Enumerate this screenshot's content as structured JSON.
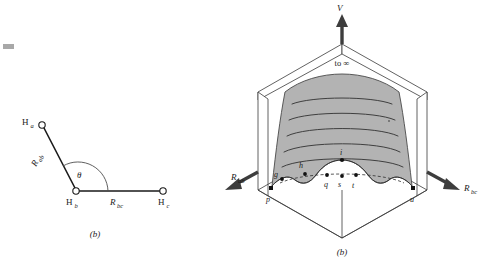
{
  "figure": {
    "background_color": "#ffffff",
    "ink_color": "#1a1a1a",
    "surface_fill": "#b3b3b3"
  },
  "panel_left": {
    "name": "h3-geometry-diagram",
    "caption": "(b)",
    "atoms": [
      {
        "id": "atom-ha",
        "element": "H",
        "subscript": "a"
      },
      {
        "id": "atom-hb",
        "element": "H",
        "subscript": "b"
      },
      {
        "id": "atom-hc",
        "element": "H",
        "subscript": "c"
      }
    ],
    "bonds": [
      {
        "id": "bond-ab",
        "label": "R",
        "subscript": "ab"
      },
      {
        "id": "bond-bc",
        "label": "R",
        "subscript": "bc"
      }
    ],
    "angle": {
      "id": "bond-angle",
      "symbol": "θ"
    }
  },
  "panel_right": {
    "name": "potential-energy-surface-3d",
    "caption": "(b)",
    "axes": [
      {
        "id": "axis-v",
        "label": "V",
        "subscript": "",
        "direction": "up"
      },
      {
        "id": "axis-rab",
        "label": "R",
        "subscript": "ab",
        "direction": "left-down"
      },
      {
        "id": "axis-rbc",
        "label": "R",
        "subscript": "bc",
        "direction": "right-down"
      }
    ],
    "annotations": [
      {
        "id": "to-infinity-label",
        "text": "to ∞"
      }
    ],
    "surface_points": [
      {
        "id": "point-g",
        "label": "g"
      },
      {
        "id": "point-h",
        "label": "h"
      },
      {
        "id": "point-i",
        "label": "i"
      },
      {
        "id": "point-q",
        "label": "q"
      },
      {
        "id": "point-s",
        "label": "s"
      },
      {
        "id": "point-t",
        "label": "t"
      },
      {
        "id": "point-p",
        "label": "p"
      },
      {
        "id": "point-u",
        "label": "u"
      }
    ],
    "contour_count": 5
  }
}
